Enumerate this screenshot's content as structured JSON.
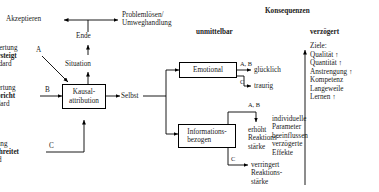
{
  "diagram": {
    "title_unmittelbar": "unmittelbar",
    "title_konsequenzen": "Konsequenzen",
    "title_verzoegert": "verzögert",
    "nodes": {
      "akzeptieren": "Akzeptieren",
      "problemloesen": "Problemlösen/\nUmweghandlung",
      "ende": "Ende",
      "situation": "Situation",
      "kausalattribution": "Kausal-\nattribution",
      "selbst": "Selbst",
      "emotional": "Emotional",
      "informationsbezogen": "Informations-\nbezogen"
    },
    "inputs": [
      {
        "id": "A",
        "line1": "Bewertung",
        "line2": "übersteigt",
        "line3": "Standard",
        "marker": "A"
      },
      {
        "id": "B",
        "line1": "Bewertung",
        "line2": "entspricht",
        "line3": "Standard",
        "marker": "B"
      },
      {
        "id": "C",
        "line1": "Bewertung",
        "line2": "unterschreitet",
        "line3": "Standard",
        "marker": "C"
      }
    ],
    "emotional_branches": [
      {
        "marker": "A, B",
        "outcome": "glücklich"
      },
      {
        "marker": "C",
        "outcome": "traurig"
      }
    ],
    "info_branches": [
      {
        "marker": "A, B",
        "outcome": "erhöht\nReaktions-\nstärke"
      },
      {
        "marker": "C",
        "outcome": "verringert\nReaktions-\nstärke"
      }
    ],
    "consequences": {
      "heading": "Ziele:",
      "items": [
        "Qualität ↑",
        "Quantität ↑",
        "Anstrengung ↑",
        "Kompetenz",
        "Langeweile",
        "Lernen ↑"
      ]
    },
    "note": "individuelle\nParameter\nbeeinflussen\nverzögerte\nEffekte"
  }
}
